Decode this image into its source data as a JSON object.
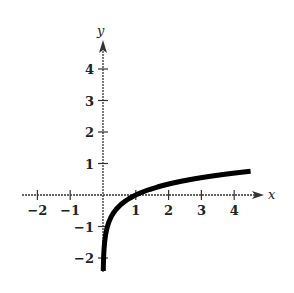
{
  "chart_data": {
    "type": "line",
    "title": "",
    "xlabel": "x",
    "ylabel": "y",
    "xlim": [
      -2,
      4.5
    ],
    "ylim": [
      -2.4,
      4.5
    ],
    "x_ticks": [
      -2,
      -1,
      1,
      2,
      3,
      4
    ],
    "y_ticks": [
      -2,
      -1,
      1,
      2,
      3,
      4
    ],
    "x_tick_labels": [
      "−2",
      "−1",
      "1",
      "2",
      "3",
      "4"
    ],
    "y_tick_labels": [
      "−2",
      "−1",
      "1",
      "2",
      "3",
      "4"
    ],
    "grid": false,
    "legend": null,
    "series": [
      {
        "name": "y = ½ ln x",
        "x": [
          0.008,
          0.05,
          0.1,
          0.25,
          0.5,
          1,
          1.5,
          2,
          2.5,
          3,
          3.5,
          4,
          4.5
        ],
        "values": [
          -2.41,
          -1.5,
          -1.15,
          -0.69,
          -0.35,
          0,
          0.2,
          0.35,
          0.46,
          0.55,
          0.63,
          0.69,
          0.75
        ]
      }
    ]
  },
  "axes": {
    "x_label": "x",
    "y_label": "y"
  },
  "colors": {
    "curve": "#000000",
    "axes": "#333333"
  }
}
